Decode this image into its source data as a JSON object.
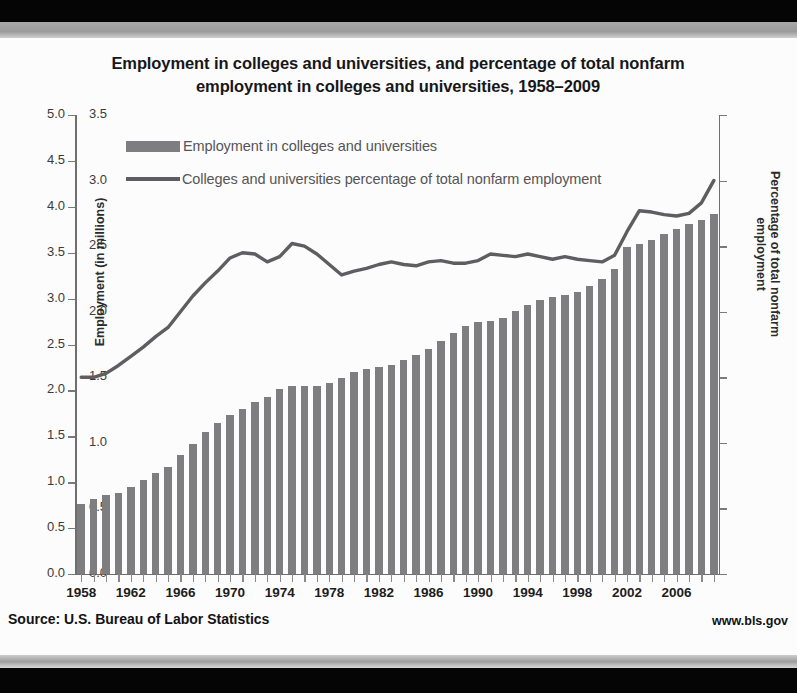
{
  "chart_data": {
    "type": "bar",
    "title": "Employment in colleges and universities, and percentage of total nonfarm employment in colleges and universities, 1958–2009",
    "title_line1": "Employment in colleges and universities, and percentage of total nonfarm",
    "title_line2": "employment in colleges and universities, 1958–2009",
    "xlabel": "",
    "ylabel": "Employment (in millions)",
    "ylabel_right": "Percentage of total nonfarm employment",
    "ylim": [
      0.0,
      5.0
    ],
    "ylim_right": [
      0.0,
      3.5
    ],
    "ytick_labels": [
      "0.0",
      "0.5",
      "1.0",
      "1.5",
      "2.0",
      "2.5",
      "3.0",
      "3.5",
      "4.0",
      "4.5",
      "5.0"
    ],
    "ytick_values": [
      0.0,
      0.5,
      1.0,
      1.5,
      2.0,
      2.5,
      3.0,
      3.5,
      4.0,
      4.5,
      5.0
    ],
    "ytick_labels_right": [
      "0.0",
      "0.5",
      "1.0",
      "1.5",
      "2.0",
      "2.5",
      "3.0",
      "3.5"
    ],
    "ytick_values_right": [
      0.0,
      0.5,
      1.0,
      1.5,
      2.0,
      2.5,
      3.0,
      3.5
    ],
    "grid": false,
    "legend_position": "upper-left-inside",
    "categories": [
      1958,
      1959,
      1960,
      1961,
      1962,
      1963,
      1964,
      1965,
      1966,
      1967,
      1968,
      1969,
      1970,
      1971,
      1972,
      1973,
      1974,
      1975,
      1976,
      1977,
      1978,
      1979,
      1980,
      1981,
      1982,
      1983,
      1984,
      1985,
      1986,
      1987,
      1988,
      1989,
      1990,
      1991,
      1992,
      1993,
      1994,
      1995,
      1996,
      1997,
      1998,
      1999,
      2000,
      2001,
      2002,
      2003,
      2004,
      2005,
      2006,
      2007,
      2008,
      2009
    ],
    "xtick_labels": [
      "1958",
      "1962",
      "1966",
      "1970",
      "1974",
      "1978",
      "1982",
      "1986",
      "1990",
      "1994",
      "1998",
      "2002",
      "2006"
    ],
    "xtick_values": [
      1958,
      1962,
      1966,
      1970,
      1974,
      1978,
      1982,
      1986,
      1990,
      1994,
      1998,
      2002,
      2006
    ],
    "series": [
      {
        "name": "Employment in colleges and universities",
        "type": "bar",
        "axis": "left",
        "unit": "millions",
        "color": "#7e7e80",
        "values": [
          0.76,
          0.82,
          0.86,
          0.88,
          0.95,
          1.02,
          1.1,
          1.17,
          1.3,
          1.42,
          1.55,
          1.65,
          1.73,
          1.8,
          1.87,
          1.93,
          2.01,
          2.05,
          2.05,
          2.05,
          2.08,
          2.14,
          2.2,
          2.23,
          2.26,
          2.28,
          2.33,
          2.39,
          2.45,
          2.54,
          2.62,
          2.7,
          2.75,
          2.76,
          2.79,
          2.86,
          2.93,
          2.99,
          3.02,
          3.04,
          3.07,
          3.14,
          3.21,
          3.32,
          3.56,
          3.6,
          3.64,
          3.7,
          3.76,
          3.81,
          3.86,
          3.92
        ]
      },
      {
        "name": "Colleges and universities percentage of total nonfarm employment",
        "type": "line",
        "axis": "right",
        "unit": "percent",
        "color": "#5e5e60",
        "values": [
          1.5,
          1.5,
          1.53,
          1.59,
          1.66,
          1.73,
          1.81,
          1.88,
          2.0,
          2.12,
          2.22,
          2.31,
          2.41,
          2.45,
          2.44,
          2.38,
          2.42,
          2.52,
          2.5,
          2.44,
          2.36,
          2.28,
          2.31,
          2.33,
          2.36,
          2.38,
          2.36,
          2.35,
          2.38,
          2.39,
          2.37,
          2.37,
          2.39,
          2.44,
          2.43,
          2.42,
          2.44,
          2.42,
          2.4,
          2.42,
          2.4,
          2.39,
          2.38,
          2.43,
          2.61,
          2.77,
          2.76,
          2.74,
          2.73,
          2.75,
          2.83,
          3.0
        ]
      }
    ]
  },
  "legend": {
    "bar_label": "Employment in colleges and universities",
    "line_label": "Colleges and universities percentage of total nonfarm employment"
  },
  "footer": {
    "source": "Source: U.S. Bureau of Labor Statistics",
    "website": "www.bls.gov"
  }
}
